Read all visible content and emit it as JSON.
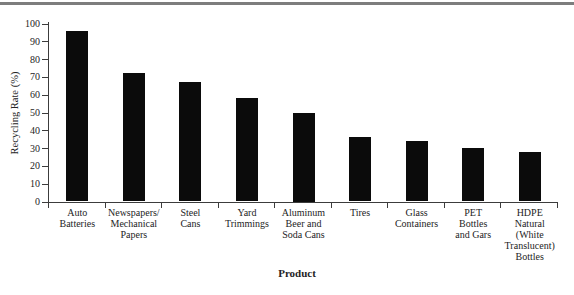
{
  "figure": {
    "background": "#ffffff",
    "top_rule_color": "#7d7d7d"
  },
  "chart_data": {
    "type": "bar",
    "title": "",
    "xlabel": "Product",
    "ylabel": "Recycling Rate (%)",
    "ylim": [
      0,
      100
    ],
    "yticks": [
      0,
      10,
      20,
      30,
      40,
      50,
      60,
      70,
      80,
      90,
      100
    ],
    "grid": false,
    "legend": null,
    "bar_color": "#0b0b0b",
    "axis_color": "#3c3c3c",
    "text_color": "#242424",
    "categories": [
      "Auto Batteries",
      "Newspapers/Mechanical Papers",
      "Steel Cans",
      "Yard Trimmings",
      "Aluminum Beer and Soda Cans",
      "Tires",
      "Glass Containers",
      "PET Bottles and Gars",
      "HDPE Natural (White Translucent) Bottles"
    ],
    "category_lines": [
      [
        "Auto",
        "Batteries"
      ],
      [
        "Newspapers/",
        "Mechanical",
        "Papers"
      ],
      [
        "Steel",
        "Cans"
      ],
      [
        "Yard",
        "Trimmings"
      ],
      [
        "Aluminum",
        "Beer and",
        "Soda Cans"
      ],
      [
        "Tires"
      ],
      [
        "Glass",
        "Containers"
      ],
      [
        "PET",
        "Bottles",
        "and Gars"
      ],
      [
        "HDPE",
        "Natural",
        "(White",
        "Translucent)",
        "Bottles"
      ]
    ],
    "values": [
      96,
      72,
      67,
      58,
      50,
      36,
      34,
      30,
      28
    ]
  }
}
